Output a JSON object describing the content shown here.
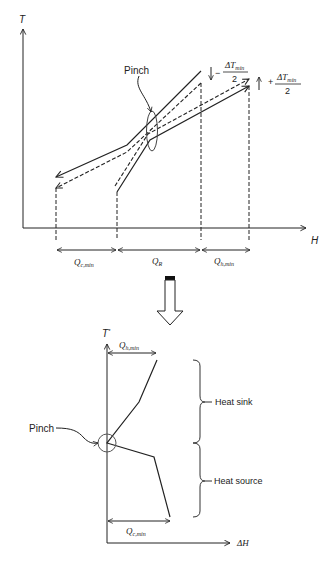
{
  "top_diagram": {
    "title": "Composite curves (T vs H)",
    "y_axis_label": "T",
    "x_axis_label": "H",
    "pinch_label": "Pinch",
    "shift_down_label": {
      "sign": "−",
      "numerator": "ΔT",
      "numerator_sub": "min",
      "denominator": "2"
    },
    "shift_up_label": {
      "sign": "+",
      "numerator": "ΔT",
      "numerator_sub": "min",
      "denominator": "2"
    },
    "spans": [
      {
        "label": "Q",
        "sub": "c,min"
      },
      {
        "label": "Q",
        "sub": "R"
      },
      {
        "label": "Q",
        "sub": "h,min"
      }
    ]
  },
  "bottom_diagram": {
    "title": "Grand composite curve (T* vs ΔH)",
    "y_axis_label": "T",
    "y_axis_sup": "*",
    "x_axis_label": "ΔH",
    "pinch_label": "Pinch",
    "top_span": {
      "label": "Q",
      "sub": "h,min"
    },
    "bottom_span": {
      "label": "Q",
      "sub": "c,min"
    },
    "brackets": [
      {
        "label": "Heat sink"
      },
      {
        "label": "Heat source"
      }
    ]
  },
  "colors": {
    "line": "#222222",
    "ellipse": "#555555",
    "background": "#ffffff"
  }
}
